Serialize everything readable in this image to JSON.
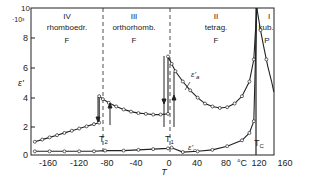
{
  "chart_data": {
    "type": "line",
    "title": "",
    "xlabel": "T",
    "x_unit": "°C",
    "ylabel": "ε'",
    "y_multiplier": "·10³",
    "xlim": [
      -182,
      143
    ],
    "ylim": [
      0,
      10
    ],
    "x_ticks": [
      -160,
      -120,
      -80,
      -40,
      0,
      40,
      80,
      120,
      160
    ],
    "y_ticks": [
      0,
      2,
      4,
      6,
      8,
      10
    ],
    "grid": false,
    "phases": [
      {
        "roman": "IV",
        "name": "rhomboedr.",
        "type": "F",
        "range": [
          -182,
          -90
        ]
      },
      {
        "roman": "III",
        "name": "orthorhomb.",
        "type": "F",
        "range": [
          -90,
          5
        ]
      },
      {
        "roman": "II",
        "name": "tetrag.",
        "type": "F",
        "range": [
          5,
          120
        ]
      },
      {
        "roman": "I",
        "name": "kub.",
        "type": "P",
        "range": [
          120,
          143
        ]
      }
    ],
    "transitions": [
      {
        "label": "T2",
        "x": -85
      },
      {
        "label": "T1",
        "x": 5
      },
      {
        "label": "TC",
        "x": 120
      }
    ],
    "series": [
      {
        "name": "ε'a",
        "points": [
          [
            -180,
            0.9
          ],
          [
            -170,
            1.05
          ],
          [
            -160,
            1.2
          ],
          [
            -150,
            1.35
          ],
          [
            -140,
            1.5
          ],
          [
            -130,
            1.65
          ],
          [
            -120,
            1.8
          ],
          [
            -110,
            1.95
          ],
          [
            -100,
            2.1
          ],
          [
            -93,
            2.2
          ],
          [
            -93,
            4.0
          ],
          [
            -88,
            3.8
          ],
          [
            -80,
            3.55
          ],
          [
            -70,
            3.3
          ],
          [
            -60,
            3.1
          ],
          [
            -50,
            2.95
          ],
          [
            -40,
            2.85
          ],
          [
            -30,
            2.8
          ],
          [
            -20,
            2.75
          ],
          [
            -10,
            2.75
          ],
          [
            0,
            2.8
          ],
          [
            0,
            6.7
          ],
          [
            5,
            6.2
          ],
          [
            10,
            5.7
          ],
          [
            20,
            5.0
          ],
          [
            30,
            4.4
          ],
          [
            40,
            3.9
          ],
          [
            50,
            3.5
          ],
          [
            60,
            3.3
          ],
          [
            70,
            3.2
          ],
          [
            80,
            3.25
          ],
          [
            90,
            3.5
          ],
          [
            100,
            4.0
          ],
          [
            110,
            5.0
          ],
          [
            116,
            6.5
          ],
          [
            120,
            10
          ]
        ]
      },
      {
        "name": "ε'c",
        "points": [
          [
            -180,
            0.25
          ],
          [
            -160,
            0.25
          ],
          [
            -140,
            0.25
          ],
          [
            -120,
            0.25
          ],
          [
            -100,
            0.25
          ],
          [
            -85,
            0.3
          ],
          [
            -60,
            0.3
          ],
          [
            -40,
            0.35
          ],
          [
            -20,
            0.4
          ],
          [
            0,
            0.45
          ],
          [
            5,
            0.5
          ],
          [
            20,
            0.2
          ],
          [
            40,
            0.25
          ],
          [
            60,
            0.35
          ],
          [
            80,
            0.6
          ],
          [
            100,
            1.0
          ],
          [
            110,
            1.5
          ],
          [
            116,
            2.3
          ],
          [
            120,
            10
          ]
        ]
      },
      {
        "name": "cubic",
        "points": [
          [
            120,
            10
          ],
          [
            125,
            8.5
          ],
          [
            130,
            7.2
          ],
          [
            135,
            6.0
          ],
          [
            140,
            5.0
          ],
          [
            143,
            4.3
          ]
        ]
      }
    ]
  },
  "labels": {
    "y_top": "10",
    "y_mult": "·10³",
    "y_8": "8",
    "y_6": "6",
    "y_4": "4",
    "y_2": "2",
    "y_0": "0",
    "ylabel": "ε'",
    "xlabel": "T",
    "x_unit": "°C",
    "x_m160": "-160",
    "x_m120": "-120",
    "x_m80": "-80",
    "x_m40": "-40",
    "x_0": "0",
    "x_40": "40",
    "x_80": "80",
    "x_120": "120",
    "x_160": "160",
    "phase4_roman": "IV",
    "phase4_name": "rhomboedr.",
    "phase4_type": "F",
    "phase3_roman": "III",
    "phase3_name": "orthorhomb.",
    "phase3_type": "F",
    "phase2_roman": "II",
    "phase2_name": "tetrag.",
    "phase2_type": "F",
    "phase1_roman": "I",
    "phase1_name": "kub.",
    "phase1_type": "P",
    "t2": "T",
    "t2_sub": "2",
    "t1": "T",
    "t1_sub": "1",
    "tc": "T",
    "tc_sub": "C",
    "ea": "ε'",
    "ea_sub": "a",
    "ec": "ε'",
    "ec_sub": "c"
  }
}
